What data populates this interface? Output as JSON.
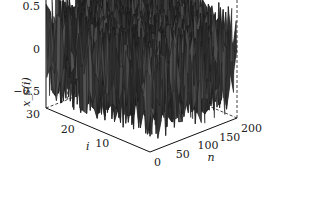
{
  "chart_data": {
    "type": "surface3d",
    "title": "",
    "xlabel": "n",
    "ylabel": "i",
    "zlabel": "x_s(i)",
    "xlim": [
      0,
      200
    ],
    "ylim": [
      0,
      30
    ],
    "zlim": [
      -0.7,
      0.7
    ],
    "x_ticks": [
      "0",
      "50",
      "100",
      "150",
      "200"
    ],
    "x_tick_values": [
      0,
      50,
      100,
      150,
      200
    ],
    "y_ticks": [
      "10",
      "20",
      "30"
    ],
    "y_tick_values": [
      10,
      20,
      30
    ],
    "z_ticks": [
      "-0.5",
      "0",
      "0.5"
    ],
    "z_tick_values": [
      -0.5,
      0,
      0.5
    ],
    "grid": false,
    "surface_description": "dense random noise surface, amplitude approx ±0.7, over n=0..200 and i=0..30",
    "surface_color": "#3a3a3a",
    "edge_color": "#1a1a1a",
    "noise_amplitude": 0.62,
    "x_samples": 100,
    "y_samples": 30
  }
}
